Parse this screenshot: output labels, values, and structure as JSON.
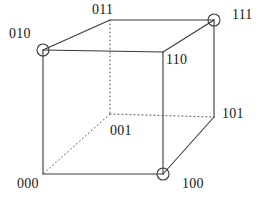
{
  "figure": {
    "name": "binary-labeled-cube",
    "background_color": "#ffffff",
    "line_color": "#3a3a3a",
    "dotted_line_color": "#555555",
    "label_color": "#1a1a1a",
    "stroke_width": 1.1,
    "width": 264,
    "height": 200
  },
  "vertices": [
    {
      "id": "v010",
      "label": "010",
      "x": 43,
      "y": 50,
      "circled": true,
      "hidden": false,
      "label_x": 9,
      "label_y": 27
    },
    {
      "id": "v011",
      "label": "011",
      "x": 110,
      "y": 20,
      "circled": false,
      "hidden": false,
      "label_x": 92,
      "label_y": 3
    },
    {
      "id": "v111",
      "label": "111",
      "x": 214,
      "y": 20,
      "circled": true,
      "hidden": false,
      "label_x": 232,
      "label_y": 8
    },
    {
      "id": "v110",
      "label": "110",
      "x": 163,
      "y": 52,
      "circled": false,
      "hidden": false,
      "label_x": 166,
      "label_y": 53
    },
    {
      "id": "v001",
      "label": "001",
      "x": 110,
      "y": 114,
      "circled": false,
      "hidden": true,
      "label_x": 110,
      "label_y": 124
    },
    {
      "id": "v101",
      "label": "101",
      "x": 214,
      "y": 117,
      "circled": false,
      "hidden": false,
      "label_x": 222,
      "label_y": 107
    },
    {
      "id": "v000",
      "label": "000",
      "x": 43,
      "y": 174,
      "circled": false,
      "hidden": false,
      "label_x": 17,
      "label_y": 177
    },
    {
      "id": "v100",
      "label": "100",
      "x": 163,
      "y": 174,
      "circled": true,
      "hidden": false,
      "label_x": 182,
      "label_y": 177
    }
  ],
  "edges": [
    {
      "id": "e-000-100",
      "from": "v000",
      "to": "v100",
      "style": "solid"
    },
    {
      "id": "e-000-010",
      "from": "v000",
      "to": "v010",
      "style": "solid"
    },
    {
      "id": "e-010-110",
      "from": "v010",
      "to": "v110",
      "style": "solid"
    },
    {
      "id": "e-110-100",
      "from": "v110",
      "to": "v100",
      "style": "solid"
    },
    {
      "id": "e-010-011",
      "from": "v010",
      "to": "v011",
      "style": "solid"
    },
    {
      "id": "e-011-111",
      "from": "v011",
      "to": "v111",
      "style": "solid"
    },
    {
      "id": "e-110-111",
      "from": "v110",
      "to": "v111",
      "style": "solid"
    },
    {
      "id": "e-111-101",
      "from": "v111",
      "to": "v101",
      "style": "solid"
    },
    {
      "id": "e-101-100",
      "from": "v101",
      "to": "v100",
      "style": "solid"
    },
    {
      "id": "e-011-001",
      "from": "v011",
      "to": "v001",
      "style": "dotted"
    },
    {
      "id": "e-001-000",
      "from": "v001",
      "to": "v000",
      "style": "dotted"
    },
    {
      "id": "e-001-101",
      "from": "v001",
      "to": "v101",
      "style": "dotted"
    }
  ],
  "circle_radius": 6
}
